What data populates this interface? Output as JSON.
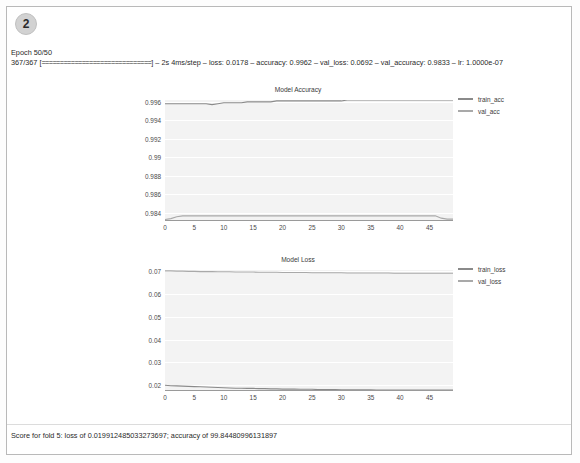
{
  "cell": {
    "badge_number": "2",
    "log": {
      "epoch_line": "Epoch 50/50",
      "progress_prefix": "367/367 [",
      "progress_bar": "==============================",
      "progress_suffix": "]",
      "metrics": " – 2s 4ms/step – loss: 0.0178 – accuracy: 0.9962 – val_loss: 0.0692 – val_accuracy: 0.9833 – lr: 1.0000e-07"
    },
    "status": "Score for fold 5: loss of 0.019912485033273697; accuracy of 99.84480996131897"
  },
  "colors": {
    "train_line": "#8a8a8a",
    "val_line": "#a9a9a9",
    "plot_background": "#f3f3f3",
    "grid": "#ffffff",
    "axis": "#9a9a9a",
    "badge": "#d2d2d2"
  },
  "chart_data": [
    {
      "type": "line",
      "title": "Model Accuracy",
      "xlabel": "",
      "ylabel": "",
      "xlim": [
        0,
        49
      ],
      "ylim": [
        0.9832,
        0.9962
      ],
      "grid": true,
      "legend_position": "right",
      "xticks": [
        0,
        5,
        10,
        15,
        20,
        25,
        30,
        35,
        40,
        45
      ],
      "yticks": [
        0.984,
        0.986,
        0.988,
        0.99,
        0.992,
        0.994,
        0.996
      ],
      "ytick_labels": [
        "0.984",
        "0.986",
        "0.988",
        "0.99",
        "0.992",
        "0.994",
        "0.996"
      ],
      "x": [
        0,
        1,
        2,
        3,
        4,
        5,
        6,
        7,
        8,
        9,
        10,
        11,
        12,
        13,
        14,
        15,
        16,
        17,
        18,
        19,
        20,
        21,
        22,
        23,
        24,
        25,
        26,
        27,
        28,
        29,
        30,
        31,
        32,
        33,
        34,
        35,
        36,
        37,
        38,
        39,
        40,
        41,
        42,
        43,
        44,
        45,
        46,
        47,
        48,
        49
      ],
      "series": [
        {
          "name": "train_acc",
          "values": [
            0.9958,
            0.9958,
            0.9958,
            0.9958,
            0.9958,
            0.9958,
            0.9958,
            0.9958,
            0.9957,
            0.9958,
            0.9959,
            0.9959,
            0.9959,
            0.9959,
            0.996,
            0.996,
            0.996,
            0.996,
            0.996,
            0.9961,
            0.9961,
            0.9961,
            0.9961,
            0.9961,
            0.9961,
            0.9961,
            0.9961,
            0.9961,
            0.9961,
            0.9961,
            0.9961,
            0.9962,
            0.9962,
            0.9962,
            0.9962,
            0.9962,
            0.9962,
            0.9962,
            0.9962,
            0.9962,
            0.9962,
            0.9962,
            0.9962,
            0.9962,
            0.9962,
            0.9962,
            0.9962,
            0.9962,
            0.9962,
            0.9962
          ]
        },
        {
          "name": "val_acc",
          "values": [
            0.98325,
            0.98335,
            0.98355,
            0.98365,
            0.98365,
            0.98365,
            0.98365,
            0.98365,
            0.98365,
            0.98365,
            0.98365,
            0.98365,
            0.98365,
            0.98365,
            0.98365,
            0.98365,
            0.98365,
            0.98365,
            0.98365,
            0.98365,
            0.98365,
            0.98365,
            0.98365,
            0.98365,
            0.98365,
            0.98365,
            0.98365,
            0.98365,
            0.98365,
            0.98365,
            0.98365,
            0.98365,
            0.98365,
            0.98365,
            0.98365,
            0.98365,
            0.98365,
            0.98365,
            0.98365,
            0.98365,
            0.98365,
            0.98365,
            0.98365,
            0.98365,
            0.98365,
            0.98365,
            0.98365,
            0.9834,
            0.9833,
            0.9833
          ]
        }
      ]
    },
    {
      "type": "line",
      "title": "Model Loss",
      "xlabel": "",
      "ylabel": "",
      "xlim": [
        0,
        49
      ],
      "ylim": [
        0.0178,
        0.0706
      ],
      "grid": true,
      "legend_position": "right",
      "xticks": [
        0,
        5,
        10,
        15,
        20,
        25,
        30,
        35,
        40,
        45
      ],
      "yticks": [
        0.02,
        0.03,
        0.04,
        0.05,
        0.06,
        0.07
      ],
      "ytick_labels": [
        "0.02",
        "0.03",
        "0.04",
        "0.05",
        "0.06",
        "0.07"
      ],
      "x": [
        0,
        1,
        2,
        3,
        4,
        5,
        6,
        7,
        8,
        9,
        10,
        11,
        12,
        13,
        14,
        15,
        16,
        17,
        18,
        19,
        20,
        21,
        22,
        23,
        24,
        25,
        26,
        27,
        28,
        29,
        30,
        31,
        32,
        33,
        34,
        35,
        36,
        37,
        38,
        39,
        40,
        41,
        42,
        43,
        44,
        45,
        46,
        47,
        48,
        49
      ],
      "series": [
        {
          "name": "train_loss",
          "values": [
            0.0199,
            0.0197,
            0.0196,
            0.0195,
            0.0194,
            0.0193,
            0.0192,
            0.0191,
            0.019,
            0.0189,
            0.0188,
            0.0187,
            0.0186,
            0.0186,
            0.0185,
            0.0185,
            0.0184,
            0.0184,
            0.0183,
            0.0183,
            0.0182,
            0.0182,
            0.0182,
            0.0181,
            0.0181,
            0.0181,
            0.018,
            0.018,
            0.018,
            0.018,
            0.0179,
            0.0179,
            0.0179,
            0.0179,
            0.0179,
            0.0179,
            0.0178,
            0.0178,
            0.0178,
            0.0178,
            0.0178,
            0.0178,
            0.0178,
            0.0178,
            0.0178,
            0.0178,
            0.0178,
            0.0178,
            0.0178,
            0.0178
          ]
        },
        {
          "name": "val_loss",
          "values": [
            0.0702,
            0.0702,
            0.0701,
            0.0701,
            0.07,
            0.07,
            0.0699,
            0.0699,
            0.0699,
            0.0698,
            0.0698,
            0.0698,
            0.0697,
            0.0697,
            0.0697,
            0.0697,
            0.0696,
            0.0696,
            0.0696,
            0.0696,
            0.0695,
            0.0695,
            0.0695,
            0.0695,
            0.0695,
            0.0694,
            0.0694,
            0.0694,
            0.0694,
            0.0694,
            0.0694,
            0.0693,
            0.0693,
            0.0693,
            0.0693,
            0.0693,
            0.0693,
            0.0693,
            0.0693,
            0.0692,
            0.0692,
            0.0692,
            0.0692,
            0.0692,
            0.0692,
            0.0692,
            0.0692,
            0.0692,
            0.0692,
            0.0692
          ]
        }
      ]
    }
  ]
}
